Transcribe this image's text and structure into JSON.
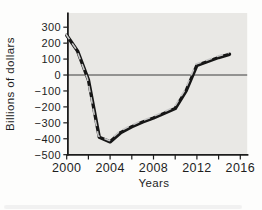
{
  "figure": {
    "y_axis_title": "Billions of dollars",
    "x_axis_title": "Years"
  },
  "chart_data": {
    "type": "line",
    "xlabel": "Years",
    "ylabel": "Billions of dollars",
    "x": [
      2000,
      2001,
      2002,
      2003,
      2004,
      2005,
      2006,
      2007,
      2008,
      2009,
      2010,
      2011,
      2012,
      2013,
      2014,
      2015
    ],
    "values": [
      250,
      150,
      -30,
      -390,
      -420,
      -360,
      -325,
      -295,
      -270,
      -240,
      -210,
      -100,
      60,
      85,
      110,
      130
    ],
    "xlim": [
      2000,
      2016
    ],
    "ylim": [
      -500,
      300
    ],
    "yticks": [
      300,
      200,
      100,
      0,
      -100,
      -200,
      -300,
      -400,
      -500
    ],
    "xticks": [
      2000,
      2002,
      2004,
      2006,
      2008,
      2010,
      2012,
      2014,
      2016
    ],
    "xtick_labels_shown": [
      2000,
      2004,
      2008,
      2012,
      2016
    ],
    "zero_line": true,
    "grid": false,
    "legend": null,
    "colors": {
      "line": "#161616",
      "line_highlight": "#c7c7c7",
      "plot_bg": "#e9e8e5",
      "axis": "#1c1c1c",
      "zero_line": "#3d3d3d",
      "page_bg": "#fdfdfc"
    }
  }
}
